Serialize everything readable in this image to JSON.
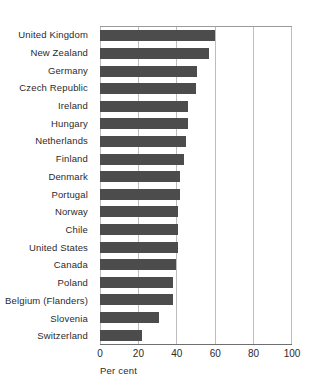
{
  "chart_data": {
    "type": "bar",
    "orientation": "horizontal",
    "title": "",
    "subtitle": "",
    "xlabel": "Per cent",
    "ylabel": "",
    "xlim": [
      0,
      100
    ],
    "xticks": [
      0,
      20,
      40,
      60,
      80,
      100
    ],
    "xticklabels": [
      "0",
      "20",
      "40",
      "60",
      "80",
      "100"
    ],
    "grid": "vertical",
    "legend": null,
    "bar_color": "#4c4c4c",
    "frame_color": "#9a9a9a",
    "gridline_color": "#bdbdbd",
    "categories": [
      "United Kingdom",
      "New Zealand",
      "Germany",
      "Czech Republic",
      "Ireland",
      "Hungary",
      "Netherlands",
      "Finland",
      "Denmark",
      "Portugal",
      "Norway",
      "Chile",
      "United States",
      "Canada",
      "Poland",
      "Belgium (Flanders)",
      "Slovenia",
      "Switzerland"
    ],
    "values": [
      60,
      57,
      51,
      50,
      46,
      46,
      45,
      44,
      42,
      42,
      41,
      41,
      41,
      40,
      38,
      38,
      31,
      22
    ],
    "series": [
      {
        "name": "Per cent",
        "values": [
          60,
          57,
          51,
          50,
          46,
          46,
          45,
          44,
          42,
          42,
          41,
          41,
          41,
          40,
          38,
          38,
          31,
          22
        ]
      }
    ]
  }
}
